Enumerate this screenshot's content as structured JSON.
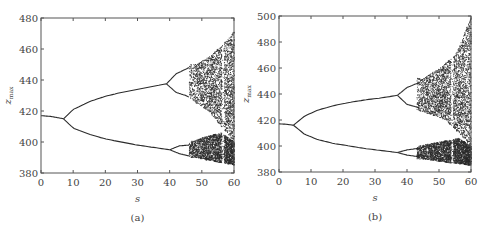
{
  "chart_data": [
    {
      "type": "scatter",
      "subplot_label": "(a)",
      "title": "",
      "xlabel": "s",
      "ylabel": "z_max",
      "xlim": [
        0,
        60
      ],
      "ylim": [
        380,
        480
      ],
      "xticks": [
        0,
        10,
        20,
        30,
        40,
        50,
        60
      ],
      "yticks": [
        380,
        400,
        420,
        440,
        460,
        480
      ],
      "grid": false,
      "description": "Bifurcation diagram: period-doubling route to chaos",
      "branches": [
        {
          "name": "period-1",
          "s": [
            0,
            3,
            7
          ],
          "z": [
            417,
            416.5,
            415
          ]
        },
        {
          "name": "period-2 upper",
          "s": [
            7,
            10,
            15,
            20,
            25,
            30,
            35,
            39
          ],
          "z": [
            415,
            421,
            426,
            429.5,
            432,
            434,
            436,
            437.5
          ]
        },
        {
          "name": "period-2 lower",
          "s": [
            7,
            10,
            15,
            20,
            25,
            30,
            35,
            40
          ],
          "z": [
            415,
            409,
            405,
            402,
            400,
            398,
            396.5,
            395
          ]
        },
        {
          "name": "period-4 upper-a",
          "s": [
            39,
            42,
            45,
            46
          ],
          "z": [
            437.5,
            444,
            447,
            448
          ]
        },
        {
          "name": "period-4 upper-b",
          "s": [
            39,
            42,
            45,
            46
          ],
          "z": [
            437.5,
            432,
            430,
            429
          ]
        },
        {
          "name": "period-4 lower-a",
          "s": [
            40,
            43,
            46
          ],
          "z": [
            395,
            397.5,
            398
          ]
        },
        {
          "name": "period-4 lower-b",
          "s": [
            40,
            43,
            46
          ],
          "z": [
            395,
            392.5,
            391
          ]
        }
      ],
      "chaos_onset_s": 48,
      "chaos_envelope": {
        "s": [
          48,
          52,
          56,
          60
        ],
        "upper": [
          450,
          455,
          462,
          472
        ],
        "lower": [
          390,
          388,
          386.5,
          385
        ]
      },
      "first_bifurcation": {
        "s": 7,
        "z": 415
      },
      "second_bifurcation": {
        "s": 39,
        "z_upper": 437.5,
        "z_lower": 395
      }
    },
    {
      "type": "scatter",
      "subplot_label": "(b)",
      "title": "",
      "xlabel": "s",
      "ylabel": "z_max",
      "xlim": [
        0,
        60
      ],
      "ylim": [
        380,
        500
      ],
      "xticks": [
        0,
        10,
        20,
        30,
        40,
        50,
        60
      ],
      "yticks": [
        380,
        400,
        420,
        440,
        460,
        480,
        500
      ],
      "grid": false,
      "description": "Bifurcation diagram: period-doubling route to chaos",
      "branches": [
        {
          "name": "period-1",
          "s": [
            0,
            2,
            4.5
          ],
          "z": [
            417,
            416.8,
            416
          ]
        },
        {
          "name": "period-2 upper",
          "s": [
            4.5,
            8,
            12,
            17,
            22,
            27,
            32,
            37
          ],
          "z": [
            416,
            423,
            427.5,
            431,
            433.5,
            435.5,
            437,
            439
          ]
        },
        {
          "name": "period-2 lower",
          "s": [
            4.5,
            8,
            12,
            17,
            22,
            27,
            32,
            37
          ],
          "z": [
            416,
            409,
            405,
            402,
            400,
            398,
            396.5,
            395
          ]
        },
        {
          "name": "period-4 upper-a",
          "s": [
            37,
            40,
            43,
            44
          ],
          "z": [
            439,
            445,
            448,
            449
          ]
        },
        {
          "name": "period-4 upper-b",
          "s": [
            37,
            40,
            43,
            44
          ],
          "z": [
            439,
            432,
            430,
            429
          ]
        },
        {
          "name": "period-4 lower-a",
          "s": [
            37,
            40,
            43,
            44
          ],
          "z": [
            395,
            397,
            398,
            398.5
          ]
        },
        {
          "name": "period-4 lower-b",
          "s": [
            37,
            40,
            43,
            44
          ],
          "z": [
            395,
            393,
            392,
            391
          ]
        }
      ],
      "chaos_onset_s": 45,
      "chaos_envelope": {
        "s": [
          45,
          50,
          55,
          60
        ],
        "upper": [
          452,
          460,
          470,
          500
        ],
        "lower": [
          390,
          388,
          386.5,
          385
        ]
      },
      "first_bifurcation": {
        "s": 4.5,
        "z": 416
      },
      "second_bifurcation": {
        "s": 37,
        "z_upper": 439,
        "z_lower": 395
      }
    }
  ],
  "figure": {
    "panels": [
      {
        "caption": "(a)",
        "xlabel": "s",
        "ylabel": "z",
        "ylabel_sub": "max",
        "xtick_labels": [
          "0",
          "10",
          "20",
          "30",
          "40",
          "50",
          "60"
        ],
        "ytick_labels": [
          "380",
          "400",
          "420",
          "440",
          "460",
          "480"
        ]
      },
      {
        "caption": "(b)",
        "xlabel": "s",
        "ylabel": "z",
        "ylabel_sub": "max",
        "xtick_labels": [
          "0",
          "10",
          "20",
          "30",
          "40",
          "50",
          "60"
        ],
        "ytick_labels": [
          "380",
          "400",
          "420",
          "440",
          "460",
          "480",
          "500"
        ]
      }
    ],
    "colors": {
      "ink": "#2b2b2b",
      "axis": "#555555",
      "background": "#ffffff"
    }
  }
}
